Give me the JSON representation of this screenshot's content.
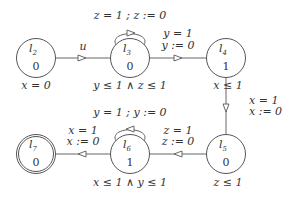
{
  "diagram": {
    "type": "timed-automaton",
    "locations": [
      {
        "id": "l2",
        "name": "l",
        "sub": "2",
        "value": "0",
        "invariant": "x = 0",
        "final": false
      },
      {
        "id": "l3",
        "name": "l",
        "sub": "3",
        "value": "0",
        "invariant": "y ≤ 1 ∧ z ≤ 1",
        "final": false
      },
      {
        "id": "l4",
        "name": "l",
        "sub": "4",
        "value": "1",
        "invariant": "x ≤ 1",
        "final": false
      },
      {
        "id": "l5",
        "name": "l",
        "sub": "5",
        "value": "0",
        "invariant": "z ≤ 1",
        "final": false
      },
      {
        "id": "l6",
        "name": "l",
        "sub": "6",
        "value": "1",
        "invariant": "x ≤ 1 ∧ y ≤ 1",
        "final": false
      },
      {
        "id": "l7",
        "name": "l",
        "sub": "7",
        "value": "0",
        "invariant": "",
        "final": true
      }
    ],
    "edges": [
      {
        "from": "l2",
        "to": "l3",
        "guard": "u",
        "reset": ""
      },
      {
        "from": "l3",
        "to": "l3",
        "label": "z = 1 ;  z := 0"
      },
      {
        "from": "l3",
        "to": "l4",
        "guard": "y = 1",
        "reset": "y := 0"
      },
      {
        "from": "l4",
        "to": "l5",
        "guard": "x = 1",
        "reset": "x := 0"
      },
      {
        "from": "l5",
        "to": "l6",
        "guard": "z = 1",
        "reset": "z := 0"
      },
      {
        "from": "l6",
        "to": "l6",
        "label": "y = 1 ;  y := 0"
      },
      {
        "from": "l6",
        "to": "l7",
        "guard": "x = 1",
        "reset": "x := 0"
      }
    ]
  }
}
